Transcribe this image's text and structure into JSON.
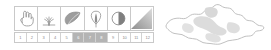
{
  "legend": {
    "title": "Vegetation phenology legend",
    "accent_color": "#b4b4b4",
    "border_color": "#c9c9c9",
    "icon_color": "#9a9a9a",
    "icons": [
      {
        "name": "hand-icon",
        "label": "hand",
        "span": 2
      },
      {
        "name": "grass-sprout-icon",
        "label": "grass sprout",
        "span": 2
      },
      {
        "name": "leaf-icon",
        "label": "leaf",
        "span": 2
      },
      {
        "name": "bud-icon",
        "label": "bud",
        "span": 2
      },
      {
        "name": "half-moon-icon",
        "label": "half circle",
        "span": 2
      },
      {
        "name": "gradient-triangle-icon",
        "label": "gradient",
        "span": 2
      }
    ],
    "months": [
      {
        "value": "1",
        "highlighted": false
      },
      {
        "value": "2",
        "highlighted": false
      },
      {
        "value": "3",
        "highlighted": false
      },
      {
        "value": "4",
        "highlighted": false
      },
      {
        "value": "5",
        "highlighted": false
      },
      {
        "value": "6",
        "highlighted": true
      },
      {
        "value": "7",
        "highlighted": true
      },
      {
        "value": "8",
        "highlighted": true
      },
      {
        "value": "9",
        "highlighted": false
      },
      {
        "value": "10",
        "highlighted": false
      },
      {
        "value": "11",
        "highlighted": false
      },
      {
        "value": "12",
        "highlighted": false
      }
    ]
  },
  "map": {
    "name": "mongolia-map",
    "label": "Mongolia",
    "outline_color": "#b9b9b9",
    "fill_color": "#ffffff",
    "region_fill": "#dcdcdc"
  }
}
